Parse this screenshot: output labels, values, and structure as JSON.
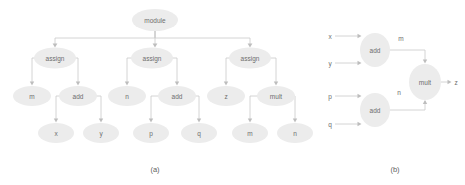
{
  "figure": {
    "background_color": "#ffffff",
    "node_fill_color": "#ececec",
    "node_text_color": "#6d6d6d",
    "edge_color": "#c9c9c9",
    "panels": [
      {
        "id": "a",
        "caption": "(a)",
        "caption_x": 155,
        "caption_y": 169,
        "type": "abstract-syntax-tree",
        "nodes": [
          {
            "id": "module",
            "label": "module",
            "cx": 155,
            "cy": 20,
            "rx": 23,
            "ry": 11
          },
          {
            "id": "assign1",
            "label": "assign",
            "cx": 55,
            "cy": 58,
            "rx": 21,
            "ry": 10.5
          },
          {
            "id": "assign2",
            "label": "assign",
            "cx": 152,
            "cy": 58,
            "rx": 21,
            "ry": 10.5
          },
          {
            "id": "assign3",
            "label": "assign",
            "cx": 250,
            "cy": 58,
            "rx": 21,
            "ry": 10.5
          },
          {
            "id": "m1",
            "label": "m",
            "cx": 32,
            "cy": 96,
            "rx": 19,
            "ry": 10
          },
          {
            "id": "add1",
            "label": "add",
            "cx": 78,
            "cy": 96,
            "rx": 19,
            "ry": 10
          },
          {
            "id": "n1",
            "label": "n",
            "cx": 127,
            "cy": 96,
            "rx": 19,
            "ry": 10
          },
          {
            "id": "add2",
            "label": "add",
            "cx": 177,
            "cy": 96,
            "rx": 19,
            "ry": 10
          },
          {
            "id": "z1",
            "label": "z",
            "cx": 226,
            "cy": 96,
            "rx": 19,
            "ry": 10
          },
          {
            "id": "mult1",
            "label": "mult",
            "cx": 276,
            "cy": 96,
            "rx": 19,
            "ry": 10
          },
          {
            "id": "x1",
            "label": "x",
            "cx": 56,
            "cy": 133,
            "rx": 18,
            "ry": 10
          },
          {
            "id": "y1",
            "label": "y",
            "cx": 101,
            "cy": 133,
            "rx": 18,
            "ry": 10
          },
          {
            "id": "p1",
            "label": "p",
            "cx": 151,
            "cy": 133,
            "rx": 18,
            "ry": 10
          },
          {
            "id": "q1",
            "label": "q",
            "cx": 199,
            "cy": 133,
            "rx": 18,
            "ry": 10
          },
          {
            "id": "m2",
            "label": "m",
            "cx": 250,
            "cy": 133,
            "rx": 18,
            "ry": 10
          },
          {
            "id": "n2",
            "label": "n",
            "cx": 295,
            "cy": 133,
            "rx": 18,
            "ry": 10
          }
        ],
        "edges": [
          {
            "from": "module",
            "to": "assign1"
          },
          {
            "from": "module",
            "to": "assign2"
          },
          {
            "from": "module",
            "to": "assign3"
          },
          {
            "from": "assign1",
            "to": "m1"
          },
          {
            "from": "assign1",
            "to": "add1"
          },
          {
            "from": "assign2",
            "to": "n1"
          },
          {
            "from": "assign2",
            "to": "add2"
          },
          {
            "from": "assign3",
            "to": "z1"
          },
          {
            "from": "assign3",
            "to": "mult1"
          },
          {
            "from": "add1",
            "to": "x1"
          },
          {
            "from": "add1",
            "to": "y1"
          },
          {
            "from": "add2",
            "to": "p1"
          },
          {
            "from": "add2",
            "to": "q1"
          },
          {
            "from": "mult1",
            "to": "m2"
          },
          {
            "from": "mult1",
            "to": "n2"
          }
        ]
      },
      {
        "id": "b",
        "caption": "(b)",
        "caption_x": 395,
        "caption_y": 169,
        "type": "dataflow-graph",
        "nodes": [
          {
            "id": "addTop",
            "label": "add",
            "cx": 375,
            "cy": 50,
            "rx": 15,
            "ry": 17
          },
          {
            "id": "addBottom",
            "label": "add",
            "cx": 375,
            "cy": 110,
            "rx": 15,
            "ry": 17
          },
          {
            "id": "mult",
            "label": "mult",
            "cx": 425,
            "cy": 82,
            "rx": 16,
            "ry": 18
          }
        ],
        "inputs": [
          {
            "id": "in-x",
            "label": "x",
            "x": 330,
            "y": 36
          },
          {
            "id": "in-y",
            "label": "y",
            "x": 330,
            "y": 63
          },
          {
            "id": "in-p",
            "label": "p",
            "x": 330,
            "y": 96
          },
          {
            "id": "in-q",
            "label": "q",
            "x": 330,
            "y": 124
          }
        ],
        "outputs": [
          {
            "id": "out-z",
            "label": "z",
            "x": 456,
            "y": 82
          }
        ],
        "edge_labels": [
          {
            "id": "wire-m",
            "label": "m",
            "x": 401,
            "y": 38
          },
          {
            "id": "wire-n",
            "label": "n",
            "x": 399,
            "y": 92
          }
        ]
      }
    ]
  }
}
